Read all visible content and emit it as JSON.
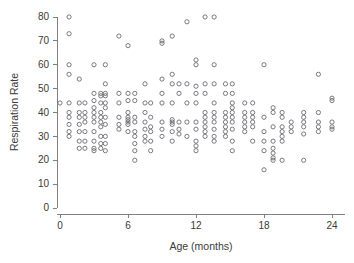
{
  "chart_data": {
    "type": "scatter",
    "title": "",
    "xlabel": "Age (months)",
    "ylabel": "Respiration Rate",
    "xlim": [
      -1.0,
      25.2
    ],
    "ylim": [
      0,
      84
    ],
    "xticks": [
      0,
      6,
      12,
      18,
      24
    ],
    "yticks": [
      0,
      10,
      20,
      30,
      40,
      50,
      60,
      70,
      80
    ],
    "xtick_labels": [
      "0",
      "6",
      "12",
      "18",
      "24"
    ],
    "ytick_labels": [
      "0",
      "10",
      "20",
      "30",
      "40",
      "50",
      "60",
      "70",
      "80"
    ],
    "grid": false,
    "legend": null,
    "marker": {
      "shape": "open-circle",
      "radius_px": 2.1,
      "stroke_color": "#6b6b73",
      "fill": "none"
    },
    "axis_color": "#808080",
    "text_color": "#3a3a3a",
    "background_color": "#ffffff",
    "points": [
      [
        0.0,
        44
      ],
      [
        0.8,
        80
      ],
      [
        0.8,
        73
      ],
      [
        0.8,
        60
      ],
      [
        0.8,
        56
      ],
      [
        0.8,
        44
      ],
      [
        0.8,
        40
      ],
      [
        0.8,
        38
      ],
      [
        0.8,
        35
      ],
      [
        0.8,
        32
      ],
      [
        0.8,
        30
      ],
      [
        1.7,
        54
      ],
      [
        1.7,
        44
      ],
      [
        1.7,
        40
      ],
      [
        1.7,
        38
      ],
      [
        1.7,
        35
      ],
      [
        1.7,
        32
      ],
      [
        1.7,
        28
      ],
      [
        1.7,
        25
      ],
      [
        2.2,
        44
      ],
      [
        2.2,
        40
      ],
      [
        2.2,
        38
      ],
      [
        2.2,
        36
      ],
      [
        2.2,
        32
      ],
      [
        2.2,
        28
      ],
      [
        2.2,
        25
      ],
      [
        3.0,
        60
      ],
      [
        3.0,
        48
      ],
      [
        3.0,
        45
      ],
      [
        3.0,
        42
      ],
      [
        3.0,
        40
      ],
      [
        3.0,
        38
      ],
      [
        3.0,
        36
      ],
      [
        3.0,
        32
      ],
      [
        3.0,
        28
      ],
      [
        3.0,
        25
      ],
      [
        3.0,
        24
      ],
      [
        3.6,
        48
      ],
      [
        3.6,
        47
      ],
      [
        3.6,
        44
      ],
      [
        3.6,
        40
      ],
      [
        3.6,
        38
      ],
      [
        3.6,
        36
      ],
      [
        3.6,
        34
      ],
      [
        3.6,
        30
      ],
      [
        3.6,
        27
      ],
      [
        3.6,
        25
      ],
      [
        4.0,
        60
      ],
      [
        4.0,
        52
      ],
      [
        4.0,
        48
      ],
      [
        4.0,
        47
      ],
      [
        4.0,
        44
      ],
      [
        4.0,
        42
      ],
      [
        4.0,
        38
      ],
      [
        4.0,
        35
      ],
      [
        4.0,
        30
      ],
      [
        4.0,
        27
      ],
      [
        4.0,
        24
      ],
      [
        5.2,
        72
      ],
      [
        5.2,
        48
      ],
      [
        5.2,
        44
      ],
      [
        5.2,
        38
      ],
      [
        5.2,
        35
      ],
      [
        5.2,
        33
      ],
      [
        6.0,
        68
      ],
      [
        6.0,
        48
      ],
      [
        6.0,
        45
      ],
      [
        6.0,
        40
      ],
      [
        6.0,
        38
      ],
      [
        6.0,
        37
      ],
      [
        6.0,
        36
      ],
      [
        6.0,
        35
      ],
      [
        6.0,
        32
      ],
      [
        6.6,
        48
      ],
      [
        6.6,
        45
      ],
      [
        6.6,
        38
      ],
      [
        6.6,
        36
      ],
      [
        6.6,
        32
      ],
      [
        6.6,
        30
      ],
      [
        6.6,
        27
      ],
      [
        6.6,
        24
      ],
      [
        6.6,
        20
      ],
      [
        7.5,
        52
      ],
      [
        7.5,
        44
      ],
      [
        7.5,
        40
      ],
      [
        7.5,
        36
      ],
      [
        7.5,
        33
      ],
      [
        7.5,
        30
      ],
      [
        7.5,
        28
      ],
      [
        8.0,
        44
      ],
      [
        8.0,
        38
      ],
      [
        8.0,
        34
      ],
      [
        8.0,
        32
      ],
      [
        8.0,
        28
      ],
      [
        8.0,
        24
      ],
      [
        9.0,
        70
      ],
      [
        9.0,
        69
      ],
      [
        9.0,
        54
      ],
      [
        9.0,
        48
      ],
      [
        9.0,
        44
      ],
      [
        9.0,
        36
      ],
      [
        9.0,
        33
      ],
      [
        9.0,
        30
      ],
      [
        9.9,
        72
      ],
      [
        9.9,
        56
      ],
      [
        9.9,
        52
      ],
      [
        9.9,
        44
      ],
      [
        9.9,
        37
      ],
      [
        9.9,
        36
      ],
      [
        9.9,
        35
      ],
      [
        9.9,
        32
      ],
      [
        9.9,
        28
      ],
      [
        10.5,
        52
      ],
      [
        10.5,
        48
      ],
      [
        10.5,
        36
      ],
      [
        10.5,
        33
      ],
      [
        10.5,
        31
      ],
      [
        11.2,
        78
      ],
      [
        11.2,
        52
      ],
      [
        11.2,
        44
      ],
      [
        11.2,
        36
      ],
      [
        11.2,
        30
      ],
      [
        12.0,
        62
      ],
      [
        12.0,
        60
      ],
      [
        12.0,
        51
      ],
      [
        12.0,
        48
      ],
      [
        12.0,
        44
      ],
      [
        12.0,
        36
      ],
      [
        12.0,
        33
      ],
      [
        12.0,
        28
      ],
      [
        12.0,
        26
      ],
      [
        12.0,
        24
      ],
      [
        12.8,
        80
      ],
      [
        12.8,
        52
      ],
      [
        12.8,
        48
      ],
      [
        12.8,
        40
      ],
      [
        12.8,
        38
      ],
      [
        12.8,
        36
      ],
      [
        12.8,
        34
      ],
      [
        12.8,
        32
      ],
      [
        12.8,
        30
      ],
      [
        13.6,
        80
      ],
      [
        13.6,
        60
      ],
      [
        13.6,
        52
      ],
      [
        13.6,
        44
      ],
      [
        13.6,
        40
      ],
      [
        13.6,
        38
      ],
      [
        13.6,
        36
      ],
      [
        13.6,
        33
      ],
      [
        13.6,
        30
      ],
      [
        13.6,
        28
      ],
      [
        14.6,
        52
      ],
      [
        14.6,
        48
      ],
      [
        14.6,
        40
      ],
      [
        14.6,
        38
      ],
      [
        14.6,
        36
      ],
      [
        14.6,
        34
      ],
      [
        14.6,
        32
      ],
      [
        14.6,
        30
      ],
      [
        15.2,
        52
      ],
      [
        15.2,
        48
      ],
      [
        15.2,
        44
      ],
      [
        15.2,
        42
      ],
      [
        15.2,
        40
      ],
      [
        15.2,
        38
      ],
      [
        15.2,
        36
      ],
      [
        15.2,
        33
      ],
      [
        15.2,
        28
      ],
      [
        15.2,
        24
      ],
      [
        16.3,
        44
      ],
      [
        16.3,
        40
      ],
      [
        16.3,
        38
      ],
      [
        16.3,
        36
      ],
      [
        16.3,
        34
      ],
      [
        16.3,
        32
      ],
      [
        17.0,
        44
      ],
      [
        17.0,
        40
      ],
      [
        17.0,
        38
      ],
      [
        17.0,
        36
      ],
      [
        17.0,
        34
      ],
      [
        17.0,
        28
      ],
      [
        18.0,
        60
      ],
      [
        18.0,
        38
      ],
      [
        18.0,
        32
      ],
      [
        18.0,
        28
      ],
      [
        18.0,
        24
      ],
      [
        18.0,
        16
      ],
      [
        18.8,
        42
      ],
      [
        18.8,
        40
      ],
      [
        18.8,
        34
      ],
      [
        18.8,
        28
      ],
      [
        18.8,
        25
      ],
      [
        18.8,
        23
      ],
      [
        18.8,
        21
      ],
      [
        18.8,
        20
      ],
      [
        19.6,
        40
      ],
      [
        19.6,
        38
      ],
      [
        19.6,
        34
      ],
      [
        19.6,
        32
      ],
      [
        19.6,
        30
      ],
      [
        19.6,
        28
      ],
      [
        19.6,
        20
      ],
      [
        20.4,
        36
      ],
      [
        20.4,
        34
      ],
      [
        20.4,
        32
      ],
      [
        21.5,
        40
      ],
      [
        21.5,
        38
      ],
      [
        21.5,
        36
      ],
      [
        21.5,
        34
      ],
      [
        21.5,
        31
      ],
      [
        21.5,
        20
      ],
      [
        22.8,
        56
      ],
      [
        22.8,
        40
      ],
      [
        22.8,
        36
      ],
      [
        22.8,
        34
      ],
      [
        22.8,
        32
      ],
      [
        24.0,
        46
      ],
      [
        24.0,
        45
      ],
      [
        24.0,
        36
      ],
      [
        24.0,
        34
      ],
      [
        24.0,
        33
      ]
    ]
  }
}
